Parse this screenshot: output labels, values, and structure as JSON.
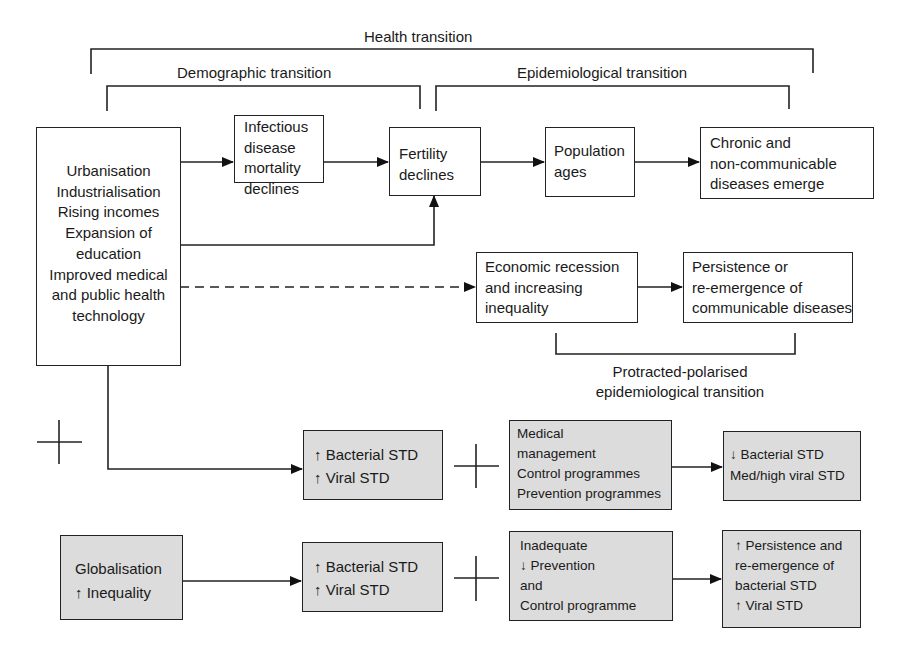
{
  "brackets": {
    "health": "Health transition",
    "demographic": "Demographic transition",
    "epidemiological": "Epidemiological transition",
    "protracted": [
      "Protracted-polarised",
      "epidemiological transition"
    ]
  },
  "boxes": {
    "drivers": [
      "Urbanisation",
      "Industrialisation",
      "Rising incomes",
      "Expansion of",
      "education",
      "Improved medical",
      "and public health",
      "technology"
    ],
    "infectious": [
      "Infectious",
      "disease",
      "mortality",
      "declines"
    ],
    "fertility": [
      "Fertility",
      "declines"
    ],
    "population": [
      "Population",
      "ages"
    ],
    "chronic": [
      "Chronic and",
      "non-communicable",
      "diseases emerge"
    ],
    "economic": [
      "Economic recession",
      "and increasing",
      "inequality"
    ],
    "persistence": [
      "Persistence or",
      "re-emergence of",
      "communicable diseases"
    ],
    "std_row1": [
      "↑ Bacterial STD",
      "↑ Viral STD"
    ],
    "medical": [
      "Medical",
      "management",
      "Control programmes",
      "Prevention programmes"
    ],
    "outcome_row1": [
      "↓ Bacterial STD",
      "Med/high viral STD"
    ],
    "globalisation": [
      "Globalisation",
      "↑ Inequality"
    ],
    "std_row2": [
      "↑ Bacterial STD",
      "↑ Viral STD"
    ],
    "inadequate": [
      "Inadequate",
      "↓ Prevention",
      "and",
      "Control programme"
    ],
    "outcome_row2": [
      "↑ Persistence and",
      "re-emergence of",
      "bacterial STD",
      "↑ Viral STD"
    ]
  },
  "colors": {
    "line": "#222222",
    "gray_fill": "#dcdcdc"
  }
}
